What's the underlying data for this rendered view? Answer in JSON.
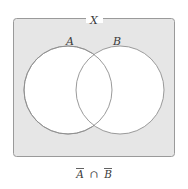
{
  "figure": {
    "type": "venn-diagram",
    "universal_set_label": "X",
    "set_labels": [
      "A",
      "B"
    ],
    "caption": {
      "full": "Ā∩B̄",
      "left_operand": "A",
      "left_operand_complement": true,
      "operator": "∩",
      "right_operand": "B",
      "right_operand_complement": true,
      "meaning": "complement of A intersect complement of B"
    },
    "shading": {
      "description": "region outside both circles is shaded",
      "shaded_region_fill": "#e6e6e6",
      "unshaded_region_fill": "#ffffff"
    },
    "colors": {
      "background": "#ffffff",
      "universe_fill": "#e6e6e6",
      "universe_stroke": "#9a9a9a",
      "circle_fill": "#ffffff",
      "circle_stroke": "#8f8f8f",
      "text": "#3a3a3a"
    },
    "geometry": {
      "universe_rect": {
        "x": 13,
        "y": 18,
        "width": 161,
        "height": 138,
        "rx": 3
      },
      "circle_a": {
        "cx": 68,
        "cy": 90,
        "r": 44
      },
      "circle_b": {
        "cx": 120,
        "cy": 90,
        "r": 44
      },
      "label_a_pos": {
        "x": 70,
        "y": 45
      },
      "label_b_pos": {
        "x": 117,
        "y": 45
      },
      "label_x_pos": {
        "x": 94,
        "y": 21
      },
      "caption_pos": {
        "x": 94,
        "y": 177
      }
    }
  }
}
